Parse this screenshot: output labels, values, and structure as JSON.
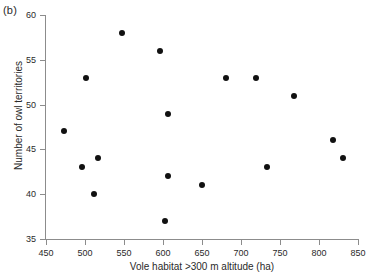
{
  "panel": {
    "label": "(b)"
  },
  "chart_data": {
    "type": "scatter",
    "title": "",
    "xlabel": "Vole habitat >300 m altitude (ha)",
    "ylabel": "Number of owl territories",
    "xlim": [
      450,
      850
    ],
    "ylim": [
      35,
      60
    ],
    "xticks": [
      450,
      500,
      550,
      600,
      650,
      700,
      750,
      800,
      850
    ],
    "yticks": [
      35,
      40,
      45,
      50,
      55,
      60
    ],
    "grid": false,
    "legend": null,
    "marker": {
      "shape": "circle",
      "color": "#111111",
      "size": 6
    },
    "points": [
      {
        "x": 473,
        "y": 47
      },
      {
        "x": 496,
        "y": 43
      },
      {
        "x": 501,
        "y": 53
      },
      {
        "x": 512,
        "y": 40
      },
      {
        "x": 517,
        "y": 44
      },
      {
        "x": 548,
        "y": 58
      },
      {
        "x": 596,
        "y": 56
      },
      {
        "x": 603,
        "y": 37
      },
      {
        "x": 606,
        "y": 49
      },
      {
        "x": 606,
        "y": 42
      },
      {
        "x": 650,
        "y": 41
      },
      {
        "x": 681,
        "y": 53
      },
      {
        "x": 719,
        "y": 53
      },
      {
        "x": 733,
        "y": 43
      },
      {
        "x": 768,
        "y": 51
      },
      {
        "x": 818,
        "y": 46
      },
      {
        "x": 831,
        "y": 44
      }
    ]
  }
}
